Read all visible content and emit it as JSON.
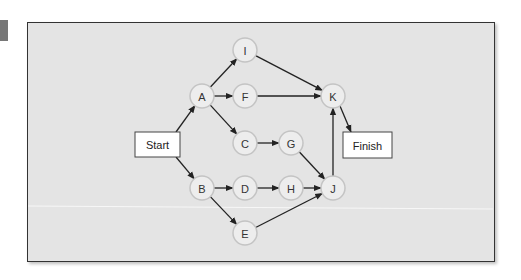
{
  "diagram": {
    "type": "activity-network",
    "terminals": {
      "start": {
        "label": "Start",
        "x": 135,
        "y": 132,
        "w": 45,
        "h": 25
      },
      "finish": {
        "label": "Finish",
        "x": 343,
        "y": 132,
        "w": 49,
        "h": 26
      }
    },
    "nodes": [
      {
        "id": "I",
        "label": "I",
        "x": 245,
        "y": 50
      },
      {
        "id": "A",
        "label": "A",
        "x": 202,
        "y": 96
      },
      {
        "id": "F",
        "label": "F",
        "x": 245,
        "y": 96
      },
      {
        "id": "K",
        "label": "K",
        "x": 333,
        "y": 96
      },
      {
        "id": "C",
        "label": "C",
        "x": 245,
        "y": 143
      },
      {
        "id": "G",
        "label": "G",
        "x": 291,
        "y": 143
      },
      {
        "id": "B",
        "label": "B",
        "x": 202,
        "y": 188
      },
      {
        "id": "D",
        "label": "D",
        "x": 245,
        "y": 188
      },
      {
        "id": "H",
        "label": "H",
        "x": 291,
        "y": 188
      },
      {
        "id": "J",
        "label": "J",
        "x": 333,
        "y": 188
      },
      {
        "id": "E",
        "label": "E",
        "x": 245,
        "y": 233
      }
    ],
    "edges": [
      [
        "Start",
        "A"
      ],
      [
        "Start",
        "B"
      ],
      [
        "A",
        "I"
      ],
      [
        "A",
        "F"
      ],
      [
        "A",
        "C"
      ],
      [
        "I",
        "K"
      ],
      [
        "F",
        "K"
      ],
      [
        "C",
        "G"
      ],
      [
        "G",
        "J"
      ],
      [
        "B",
        "D"
      ],
      [
        "B",
        "E"
      ],
      [
        "D",
        "H"
      ],
      [
        "H",
        "J"
      ],
      [
        "E",
        "J"
      ],
      [
        "J",
        "K"
      ],
      [
        "K",
        "Finish"
      ]
    ],
    "colors": {
      "panel": "#e4e4e4",
      "node_fill": "#ededed",
      "node_stroke": "#c4c4c4",
      "edge": "#222222",
      "frame": "#333333"
    }
  }
}
